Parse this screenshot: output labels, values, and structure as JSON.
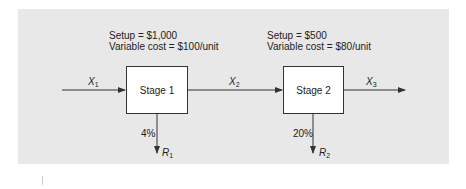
{
  "diagram": {
    "type": "two-stage production flow",
    "stages": [
      {
        "label": "Stage 1",
        "setup": "Setup = $1,000",
        "variable_cost": "Variable cost = $100/unit",
        "reject_rate": "4%",
        "reject_var": "R",
        "reject_sub": "1"
      },
      {
        "label": "Stage 2",
        "setup": "Setup = $500",
        "variable_cost": "Variable cost = $80/unit",
        "reject_rate": "20%",
        "reject_var": "R",
        "reject_sub": "2"
      }
    ],
    "flows": [
      {
        "var": "X",
        "sub": "1"
      },
      {
        "var": "X",
        "sub": "2"
      },
      {
        "var": "X",
        "sub": "3"
      }
    ],
    "colors": {
      "panel": "#e8e8e8",
      "box": "#ffffff",
      "line": "#333333"
    }
  }
}
